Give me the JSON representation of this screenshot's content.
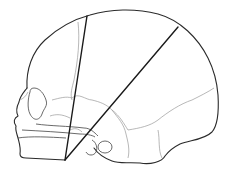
{
  "figure": {
    "measurement_lines": [
      {
        "name": "line-1",
        "from": [
          65,
          160
        ],
        "to": [
          87,
          16
        ]
      },
      {
        "name": "line-2",
        "from": [
          65,
          160
        ],
        "to": [
          178,
          27
        ]
      }
    ],
    "colors": {
      "outline": "#2a2a2a",
      "suture": "#9a9a9a",
      "measure": "#1a1a1a",
      "background": "#ffffff"
    }
  }
}
